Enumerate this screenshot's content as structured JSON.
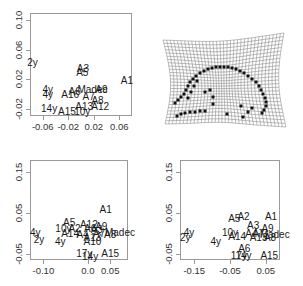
{
  "chart_data": [
    {
      "type": "scatter",
      "title": "",
      "xlabel": "",
      "ylabel": "",
      "xlim": [
        -0.08,
        0.08
      ],
      "ylim": [
        -0.03,
        0.11
      ],
      "x_ticks": [
        "-0.06",
        "-0.02",
        "0.02",
        "0.06"
      ],
      "y_ticks": [
        "-0.02",
        "0.02",
        "0.06",
        "0.10"
      ],
      "grid": false,
      "points": [
        {
          "label": "2y",
          "x": -0.076,
          "y": 0.042
        },
        {
          "label": "A3",
          "x": 0.003,
          "y": 0.034
        },
        {
          "label": "A5",
          "x": 0.002,
          "y": 0.028
        },
        {
          "label": "A1",
          "x": 0.072,
          "y": 0.017
        },
        {
          "label": "4y",
          "x": -0.052,
          "y": 0.005
        },
        {
          "label": "4y",
          "x": -0.052,
          "y": -0.002
        },
        {
          "label": "A6",
          "x": -0.01,
          "y": 0.003
        },
        {
          "label": "Madec",
          "x": 0.018,
          "y": 0.005
        },
        {
          "label": "A9",
          "x": 0.032,
          "y": 0.006
        },
        {
          "label": "A16",
          "x": -0.017,
          "y": -0.002
        },
        {
          "label": "A7",
          "x": 0.012,
          "y": -0.004
        },
        {
          "label": "A8",
          "x": 0.026,
          "y": -0.01
        },
        {
          "label": "A12",
          "x": 0.03,
          "y": -0.018
        },
        {
          "label": "A13",
          "x": 0.005,
          "y": -0.018
        },
        {
          "label": "14y",
          "x": -0.05,
          "y": -0.02
        },
        {
          "label": "A15",
          "x": -0.022,
          "y": -0.024
        },
        {
          "label": "10y",
          "x": 0.002,
          "y": -0.025
        }
      ]
    },
    {
      "type": "other",
      "description": "Thin-plate spline deformation grid with landmark points forming an arc"
    },
    {
      "type": "scatter",
      "title": "",
      "xlabel": "",
      "ylabel": "",
      "xlim": [
        -0.13,
        0.09
      ],
      "ylim": [
        -0.065,
        0.18
      ],
      "x_ticks": [
        "-0.10",
        "0.0",
        "0.05"
      ],
      "y_ticks": [
        "-0.05",
        "0.05",
        "0.15"
      ],
      "grid": false,
      "points": [
        {
          "label": "A1",
          "x": 0.04,
          "y": 0.058
        },
        {
          "label": "A5",
          "x": -0.042,
          "y": 0.025
        },
        {
          "label": "A12",
          "x": 0.002,
          "y": 0.02
        },
        {
          "label": "A9",
          "x": 0.03,
          "y": 0.015
        },
        {
          "label": "10y",
          "x": -0.055,
          "y": 0.012
        },
        {
          "label": "A2",
          "x": -0.03,
          "y": 0.012
        },
        {
          "label": "A6",
          "x": 0.005,
          "y": 0.01
        },
        {
          "label": "A3",
          "x": 0.02,
          "y": 0.008
        },
        {
          "label": "4y",
          "x": -0.118,
          "y": 0.0
        },
        {
          "label": "A14",
          "x": -0.04,
          "y": -0.001
        },
        {
          "label": "A4",
          "x": -0.012,
          "y": -0.004
        },
        {
          "label": "A7",
          "x": 0.025,
          "y": -0.001
        },
        {
          "label": "Madec",
          "x": 0.072,
          "y": 0.001
        },
        {
          "label": "A8",
          "x": 0.05,
          "y": -0.003
        },
        {
          "label": "A13",
          "x": 0.01,
          "y": -0.01
        },
        {
          "label": "2y",
          "x": -0.11,
          "y": -0.015
        },
        {
          "label": "4y",
          "x": -0.062,
          "y": -0.022
        },
        {
          "label": "A10",
          "x": 0.01,
          "y": -0.02
        },
        {
          "label": "17y",
          "x": -0.008,
          "y": -0.05
        },
        {
          "label": "A15",
          "x": 0.05,
          "y": -0.05
        },
        {
          "label": "14y",
          "x": 0.005,
          "y": -0.058
        }
      ]
    },
    {
      "type": "scatter",
      "title": "",
      "xlabel": "",
      "ylabel": "",
      "xlim": [
        -0.19,
        0.09
      ],
      "ylim": [
        -0.065,
        0.18
      ],
      "x_ticks": [
        "-0.15",
        "-0.05",
        "0.05"
      ],
      "y_ticks": [
        "-0.05",
        "0.05",
        "0.15"
      ],
      "grid": false,
      "points": [
        {
          "label": "A5",
          "x": -0.038,
          "y": 0.035
        },
        {
          "label": "A2",
          "x": -0.012,
          "y": 0.04
        },
        {
          "label": "A1",
          "x": 0.065,
          "y": 0.04
        },
        {
          "label": "A3",
          "x": 0.015,
          "y": 0.018
        },
        {
          "label": "A9",
          "x": 0.055,
          "y": 0.012
        },
        {
          "label": "4y",
          "x": -0.165,
          "y": 0.0
        },
        {
          "label": "2y",
          "x": -0.175,
          "y": -0.01
        },
        {
          "label": "10y",
          "x": -0.05,
          "y": 0.0
        },
        {
          "label": "A14",
          "x": -0.03,
          "y": -0.008
        },
        {
          "label": "A4",
          "x": 0.01,
          "y": -0.002
        },
        {
          "label": "A7",
          "x": 0.03,
          "y": -0.002
        },
        {
          "label": "Madec",
          "x": 0.075,
          "y": -0.004
        },
        {
          "label": "A13",
          "x": 0.03,
          "y": -0.012
        },
        {
          "label": "A8",
          "x": 0.062,
          "y": -0.012
        },
        {
          "label": "4y",
          "x": -0.09,
          "y": -0.02
        },
        {
          "label": "A6",
          "x": -0.01,
          "y": -0.038
        },
        {
          "label": "17y",
          "x": -0.025,
          "y": -0.055
        },
        {
          "label": "14y",
          "x": -0.012,
          "y": -0.055
        },
        {
          "label": "A15",
          "x": 0.06,
          "y": -0.055
        }
      ]
    }
  ],
  "grid_panel": {
    "landmarks": [
      [
        175,
        103
      ],
      [
        178,
        100
      ],
      [
        181,
        97
      ],
      [
        184,
        94
      ],
      [
        186,
        90
      ],
      [
        188,
        86
      ],
      [
        190,
        82
      ],
      [
        193,
        79
      ],
      [
        196,
        76
      ],
      [
        200,
        73
      ],
      [
        204,
        71
      ],
      [
        208,
        69
      ],
      [
        212,
        68
      ],
      [
        216,
        67
      ],
      [
        220,
        67
      ],
      [
        224,
        67
      ],
      [
        228,
        67
      ],
      [
        232,
        68
      ],
      [
        236,
        69
      ],
      [
        240,
        71
      ],
      [
        244,
        73
      ],
      [
        248,
        76
      ],
      [
        252,
        79
      ],
      [
        256,
        82
      ],
      [
        259,
        86
      ],
      [
        261,
        90
      ],
      [
        263,
        94
      ],
      [
        265,
        98
      ],
      [
        266,
        102
      ],
      [
        266,
        106
      ],
      [
        264,
        110
      ],
      [
        262,
        113
      ],
      [
        188,
        98
      ],
      [
        191,
        92
      ],
      [
        194,
        86
      ],
      [
        197,
        81
      ],
      [
        205,
        92
      ],
      [
        210,
        90
      ],
      [
        213,
        97
      ],
      [
        213,
        104
      ],
      [
        177,
        116
      ],
      [
        181,
        114
      ],
      [
        185,
        113
      ],
      [
        190,
        112
      ],
      [
        195,
        112
      ],
      [
        200,
        111
      ],
      [
        205,
        111
      ],
      [
        227,
        114
      ],
      [
        243,
        117
      ],
      [
        252,
        108
      ],
      [
        248,
        112
      ],
      [
        241,
        106
      ]
    ]
  }
}
